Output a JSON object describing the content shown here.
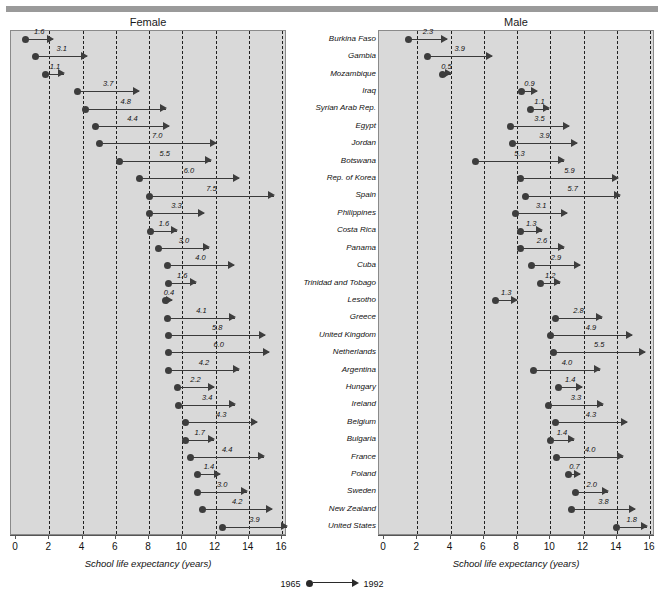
{
  "header": {
    "rule": "top-rule"
  },
  "panels": [
    {
      "key": "female",
      "title": "Female"
    },
    {
      "key": "male",
      "title": "Male"
    }
  ],
  "axis": {
    "label": "School life expectancy (years)",
    "ticks": [
      0,
      2,
      4,
      6,
      8,
      10,
      12,
      14,
      16
    ],
    "min": 0,
    "max": 16
  },
  "legend": {
    "start_year": "1965",
    "end_year": "1992"
  },
  "footnote": "",
  "chart_data": {
    "type": "scatter",
    "xlabel": "School life expectancy (years)",
    "ylabel": "",
    "xlim": [
      0,
      16
    ],
    "grid": true,
    "legend_position": "bottom-center",
    "categories": [
      "Burkina Faso",
      "Gambia",
      "Mozambique",
      "Iraq",
      "Syrian Arab Rep.",
      "Egypt",
      "Jordan",
      "Botswana",
      "Rep. of Korea",
      "Spain",
      "Philippines",
      "Costa Rica",
      "Panama",
      "Cuba",
      "Trinidad and Tobago",
      "Lesotho",
      "Greece",
      "United Kingdom",
      "Netherlands",
      "Argentina",
      "Hungary",
      "Ireland",
      "Belgium",
      "Bulgaria",
      "France",
      "Poland",
      "Sweden",
      "New Zealand",
      "United States"
    ],
    "series": [
      {
        "name": "Female",
        "points": [
          {
            "country": "Burkina Faso",
            "start": 0.6,
            "change": 1.6,
            "end": 2.2
          },
          {
            "country": "Gambia",
            "start": 1.2,
            "change": 3.1,
            "end": 4.3
          },
          {
            "country": "Mozambique",
            "start": 1.8,
            "change": 1.1,
            "end": 2.9
          },
          {
            "country": "Iraq",
            "start": 3.7,
            "change": 3.7,
            "end": 7.4
          },
          {
            "country": "Syrian Arab Rep.",
            "start": 4.2,
            "change": 4.8,
            "end": 9.0
          },
          {
            "country": "Egypt",
            "start": 4.8,
            "change": 4.4,
            "end": 9.2
          },
          {
            "country": "Jordan",
            "start": 5.0,
            "change": 7.0,
            "end": 12.0
          },
          {
            "country": "Botswana",
            "start": 6.2,
            "change": 5.5,
            "end": 11.7
          },
          {
            "country": "Rep. of Korea",
            "start": 7.4,
            "change": 6.0,
            "end": 13.4
          },
          {
            "country": "Spain",
            "start": 8.0,
            "change": 7.5,
            "end": 15.5
          },
          {
            "country": "Philippines",
            "start": 8.0,
            "change": 3.3,
            "end": 11.3
          },
          {
            "country": "Costa Rica",
            "start": 8.1,
            "change": 1.6,
            "end": 9.7
          },
          {
            "country": "Panama",
            "start": 8.6,
            "change": 3.0,
            "end": 11.6
          },
          {
            "country": "Cuba",
            "start": 9.1,
            "change": 4.0,
            "end": 13.1
          },
          {
            "country": "Trinidad and Tobago",
            "start": 9.2,
            "change": 1.6,
            "end": 10.8
          },
          {
            "country": "Lesotho",
            "start": 9.0,
            "change": 0.4,
            "end": 9.4
          },
          {
            "country": "Greece",
            "start": 9.1,
            "change": 4.1,
            "end": 13.2
          },
          {
            "country": "United Kingdom",
            "start": 9.2,
            "change": 5.8,
            "end": 15.0
          },
          {
            "country": "Netherlands",
            "start": 9.2,
            "change": 6.0,
            "end": 15.2
          },
          {
            "country": "Argentina",
            "start": 9.2,
            "change": 4.2,
            "end": 13.4
          },
          {
            "country": "Hungary",
            "start": 9.7,
            "change": 2.2,
            "end": 11.9
          },
          {
            "country": "Ireland",
            "start": 9.8,
            "change": 3.4,
            "end": 13.2
          },
          {
            "country": "Belgium",
            "start": 10.2,
            "change": 4.3,
            "end": 14.5
          },
          {
            "country": "Bulgaria",
            "start": 10.2,
            "change": 1.7,
            "end": 11.9
          },
          {
            "country": "France",
            "start": 10.5,
            "change": 4.4,
            "end": 14.9
          },
          {
            "country": "Poland",
            "start": 10.9,
            "change": 1.4,
            "end": 12.3
          },
          {
            "country": "Sweden",
            "start": 10.9,
            "change": 3.0,
            "end": 13.9
          },
          {
            "country": "New Zealand",
            "start": 11.2,
            "change": 4.2,
            "end": 15.4
          },
          {
            "country": "United States",
            "start": 12.4,
            "change": 3.9,
            "end": 16.3
          }
        ]
      },
      {
        "name": "Male",
        "points": [
          {
            "country": "Burkina Faso",
            "start": 1.5,
            "change": 2.3,
            "end": 3.8
          },
          {
            "country": "Gambia",
            "start": 2.6,
            "change": 3.9,
            "end": 6.5
          },
          {
            "country": "Mozambique",
            "start": 3.5,
            "change": 0.5,
            "end": 4.0
          },
          {
            "country": "Iraq",
            "start": 8.3,
            "change": 0.9,
            "end": 9.2
          },
          {
            "country": "Syrian Arab Rep.",
            "start": 8.8,
            "change": 1.1,
            "end": 9.9
          },
          {
            "country": "Egypt",
            "start": 7.6,
            "change": 3.5,
            "end": 11.1
          },
          {
            "country": "Jordan",
            "start": 7.7,
            "change": 3.9,
            "end": 11.6
          },
          {
            "country": "Botswana",
            "start": 5.5,
            "change": 5.3,
            "end": 10.8
          },
          {
            "country": "Rep. of Korea",
            "start": 8.2,
            "change": 5.9,
            "end": 14.1
          },
          {
            "country": "Spain",
            "start": 8.5,
            "change": 5.7,
            "end": 14.2
          },
          {
            "country": "Philippines",
            "start": 7.9,
            "change": 3.1,
            "end": 11.0
          },
          {
            "country": "Costa Rica",
            "start": 8.2,
            "change": 1.3,
            "end": 9.5
          },
          {
            "country": "Panama",
            "start": 8.2,
            "change": 2.6,
            "end": 10.8
          },
          {
            "country": "Cuba",
            "start": 8.9,
            "change": 2.9,
            "end": 11.8
          },
          {
            "country": "Trinidad and Tobago",
            "start": 9.4,
            "change": 1.2,
            "end": 10.6
          },
          {
            "country": "Lesotho",
            "start": 6.7,
            "change": 1.3,
            "end": 8.0
          },
          {
            "country": "Greece",
            "start": 10.3,
            "change": 2.8,
            "end": 13.1
          },
          {
            "country": "United Kingdom",
            "start": 10.0,
            "change": 4.9,
            "end": 14.9
          },
          {
            "country": "Netherlands",
            "start": 10.2,
            "change": 5.5,
            "end": 15.7
          },
          {
            "country": "Argentina",
            "start": 9.0,
            "change": 4.0,
            "end": 13.0
          },
          {
            "country": "Hungary",
            "start": 10.5,
            "change": 1.4,
            "end": 11.9
          },
          {
            "country": "Ireland",
            "start": 9.9,
            "change": 3.3,
            "end": 13.2
          },
          {
            "country": "Belgium",
            "start": 10.3,
            "change": 4.3,
            "end": 14.6
          },
          {
            "country": "Bulgaria",
            "start": 10.0,
            "change": 1.4,
            "end": 11.4
          },
          {
            "country": "France",
            "start": 10.4,
            "change": 4.0,
            "end": 14.4
          },
          {
            "country": "Poland",
            "start": 11.1,
            "change": 0.7,
            "end": 11.8
          },
          {
            "country": "Sweden",
            "start": 11.5,
            "change": 2.0,
            "end": 13.5
          },
          {
            "country": "New Zealand",
            "start": 11.3,
            "change": 3.8,
            "end": 15.1
          },
          {
            "country": "United States",
            "start": 14.0,
            "change": 1.8,
            "end": 15.8
          }
        ]
      }
    ]
  }
}
